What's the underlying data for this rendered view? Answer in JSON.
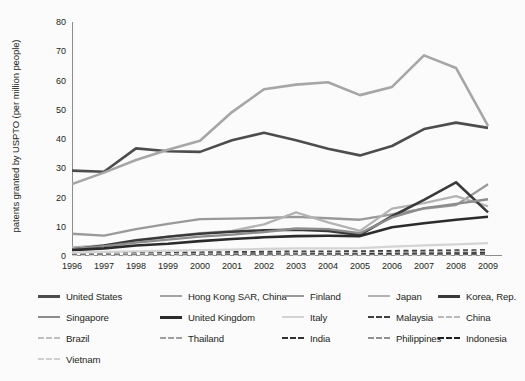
{
  "chart_data": {
    "type": "line",
    "title": "",
    "subtitle": "",
    "xlabel": "",
    "ylabel": "patents granted by USPTO (per million people)",
    "x": [
      1996,
      1997,
      1998,
      1999,
      2000,
      2001,
      2002,
      2003,
      2004,
      2005,
      2006,
      2007,
      2008,
      2009
    ],
    "xtick_labels": [
      "1996",
      "1997",
      "1998",
      "1999",
      "2000",
      "2001",
      "2002",
      "2003",
      "2004",
      "2005",
      "2006",
      "2007",
      "2008",
      "2009"
    ],
    "ytick_labels": [
      "0",
      "10",
      "20",
      "30",
      "40",
      "50",
      "60",
      "70",
      "80"
    ],
    "ytick_values": [
      0,
      10,
      20,
      30,
      40,
      50,
      60,
      70,
      80
    ],
    "xlim": [
      1996,
      2009
    ],
    "ylim": [
      0,
      80
    ],
    "grid": false,
    "legend_position": "bottom",
    "series": [
      {
        "name": "United States",
        "color": "#4d4d4d",
        "width": 2.6,
        "dash": "solid",
        "values": [
          29.2,
          28.8,
          36.8,
          35.8,
          35.6,
          39.6,
          42.1,
          39.6,
          36.7,
          34.4,
          37.6,
          43.4,
          45.6,
          43.8
        ]
      },
      {
        "name": "Hong Kong SAR, China",
        "color": "#a6a6a6",
        "width": 2.6,
        "dash": "solid",
        "values": [
          24.6,
          28.5,
          32.8,
          36.3,
          39.4,
          49.2,
          57.0,
          58.6,
          59.4,
          55.0,
          57.8,
          68.6,
          64.3,
          44.5
        ]
      },
      {
        "name": "Finland",
        "color": "#999999",
        "width": 2.3,
        "dash": "solid",
        "values": [
          7.6,
          7.0,
          9.2,
          11.0,
          12.6,
          12.8,
          13.0,
          13.4,
          12.9,
          12.4,
          14.2,
          16.2,
          17.4,
          24.5
        ]
      },
      {
        "name": "Japan",
        "color": "#b3b3b3",
        "width": 2.3,
        "dash": "solid",
        "values": [
          2.9,
          3.6,
          4.8,
          6.6,
          7.8,
          8.6,
          10.8,
          14.9,
          11.5,
          8.6,
          16.2,
          18.1,
          20.5,
          17.0
        ]
      },
      {
        "name": "Korea, Rep.",
        "color": "#3a3a3a",
        "width": 2.6,
        "dash": "solid",
        "values": [
          2.2,
          3.6,
          5.4,
          6.6,
          7.6,
          8.3,
          8.8,
          9.0,
          8.6,
          7.2,
          13.6,
          19.2,
          25.2,
          14.9
        ]
      },
      {
        "name": "Singapore",
        "color": "#8c8c8c",
        "width": 2.3,
        "dash": "solid",
        "values": [
          2.3,
          3.4,
          4.6,
          5.6,
          6.6,
          7.3,
          8.2,
          9.4,
          9.2,
          7.8,
          13.2,
          16.4,
          17.8,
          19.4
        ]
      },
      {
        "name": "United Kingdom",
        "color": "#2b2b2b",
        "width": 2.6,
        "dash": "solid",
        "values": [
          2.0,
          2.6,
          3.6,
          4.2,
          5.1,
          5.8,
          6.4,
          6.8,
          6.9,
          6.8,
          9.8,
          11.2,
          12.4,
          13.4
        ]
      },
      {
        "name": "Italy",
        "color": "#d4d4d4",
        "width": 2.3,
        "dash": "solid",
        "values": [
          1.2,
          1.4,
          1.6,
          1.8,
          2.0,
          2.2,
          2.4,
          2.6,
          2.6,
          2.7,
          3.2,
          3.6,
          4.0,
          4.4
        ]
      },
      {
        "name": "Malaysia",
        "color": "#404040",
        "width": 2.2,
        "dash": "dashed",
        "values": [
          0.8,
          0.9,
          1.0,
          1.1,
          1.2,
          1.3,
          1.4,
          1.5,
          1.5,
          1.6,
          1.7,
          1.8,
          1.9,
          2.0
        ]
      },
      {
        "name": "China",
        "color": "#b8b8b8",
        "width": 2.2,
        "dash": "dashed",
        "values": [
          0.4,
          0.4,
          0.5,
          0.5,
          0.6,
          0.6,
          0.7,
          0.8,
          0.9,
          1.0,
          1.1,
          1.2,
          1.4,
          1.5
        ]
      },
      {
        "name": "Brazil",
        "color": "#bfbfbf",
        "width": 2.2,
        "dash": "dashed",
        "values": [
          0.5,
          0.5,
          0.6,
          0.6,
          0.7,
          0.7,
          0.7,
          0.8,
          0.8,
          0.8,
          0.9,
          0.9,
          1.0,
          1.0
        ]
      },
      {
        "name": "Thailand",
        "color": "#a0a0a0",
        "width": 2.2,
        "dash": "dashed",
        "values": [
          0.3,
          0.3,
          0.4,
          0.4,
          0.4,
          0.5,
          0.5,
          0.5,
          0.6,
          0.6,
          0.6,
          0.7,
          0.7,
          0.8
        ]
      },
      {
        "name": "India",
        "color": "#333333",
        "width": 2.2,
        "dash": "dashed",
        "values": [
          0.2,
          0.2,
          0.3,
          0.3,
          0.4,
          0.4,
          0.5,
          0.5,
          0.6,
          0.6,
          0.7,
          0.8,
          0.9,
          1.0
        ]
      },
      {
        "name": "Philippines",
        "color": "#909090",
        "width": 2.2,
        "dash": "dashed",
        "values": [
          0.15,
          0.15,
          0.2,
          0.2,
          0.25,
          0.25,
          0.3,
          0.3,
          0.3,
          0.35,
          0.35,
          0.4,
          0.4,
          0.45
        ]
      },
      {
        "name": "Indonesia",
        "color": "#1f1f1f",
        "width": 2.2,
        "dash": "dashed",
        "values": [
          0.05,
          0.05,
          0.08,
          0.08,
          0.1,
          0.1,
          0.12,
          0.12,
          0.14,
          0.14,
          0.16,
          0.16,
          0.18,
          0.2
        ]
      },
      {
        "name": "Vietnam",
        "color": "#cfcfcf",
        "width": 2.2,
        "dash": "dashed",
        "values": [
          0.02,
          0.02,
          0.03,
          0.03,
          0.04,
          0.04,
          0.05,
          0.05,
          0.06,
          0.06,
          0.07,
          0.07,
          0.08,
          0.08
        ]
      }
    ]
  },
  "axes": {
    "ylabel": "patents granted by USPTO (per million people)",
    "axis_color": "#231f20"
  },
  "legend": {
    "rows": [
      [
        {
          "name": "United States",
          "color": "#4d4d4d",
          "dash": "solid",
          "thick": true
        },
        {
          "name": "Hong Kong SAR, China",
          "color": "#a6a6a6",
          "dash": "solid",
          "thick": false
        },
        {
          "name": "Finland",
          "color": "#999999",
          "dash": "solid",
          "thick": false
        },
        {
          "name": "Japan",
          "color": "#b3b3b3",
          "dash": "solid",
          "thick": false
        },
        {
          "name": "Korea, Rep.",
          "color": "#3a3a3a",
          "dash": "solid",
          "thick": true
        }
      ],
      [
        {
          "name": "Singapore",
          "color": "#8c8c8c",
          "dash": "solid",
          "thick": false
        },
        {
          "name": "United Kingdom",
          "color": "#2b2b2b",
          "dash": "solid",
          "thick": true
        },
        {
          "name": "Italy",
          "color": "#d4d4d4",
          "dash": "solid",
          "thick": false
        },
        {
          "name": "Malaysia",
          "color": "#404040",
          "dash": "dashed",
          "thick": false
        },
        {
          "name": "China",
          "color": "#b8b8b8",
          "dash": "dashed",
          "thick": false
        }
      ],
      [
        {
          "name": "Brazil",
          "color": "#bfbfbf",
          "dash": "dashed",
          "thick": false
        },
        {
          "name": "Thailand",
          "color": "#a0a0a0",
          "dash": "dashed",
          "thick": false
        },
        {
          "name": "India",
          "color": "#333333",
          "dash": "dashed",
          "thick": false
        },
        {
          "name": "Philippines",
          "color": "#909090",
          "dash": "dashed",
          "thick": false
        },
        {
          "name": "Indonesia",
          "color": "#1f1f1f",
          "dash": "dashed",
          "thick": false
        }
      ],
      [
        {
          "name": "Vietnam",
          "color": "#cfcfcf",
          "dash": "dashed",
          "thick": false
        }
      ]
    ]
  }
}
